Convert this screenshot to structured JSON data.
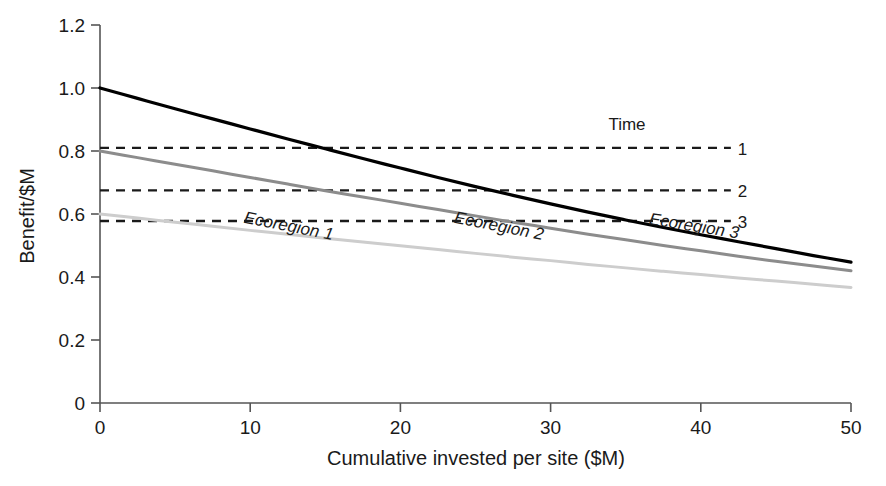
{
  "chart_data": {
    "type": "line",
    "title": "",
    "xlabel": "Cumulative invested per site ($M)",
    "ylabel": "Benefit/$M",
    "xlim": [
      0,
      50
    ],
    "ylim": [
      0,
      1.2
    ],
    "grid": false,
    "legend_position": "inline-right",
    "xticks": [
      "0",
      "10",
      "20",
      "30",
      "40",
      "50"
    ],
    "xtick_values": [
      0,
      10,
      20,
      30,
      40,
      50
    ],
    "yticks": [
      "0",
      "0.2",
      "0.4",
      "0.6",
      "0.8",
      "1.0",
      "1.2"
    ],
    "ytick_values": [
      0,
      0.2,
      0.4,
      0.6,
      0.8,
      1.0,
      1.2
    ],
    "series": [
      {
        "name": "Ecoregion 3",
        "color": "#000000",
        "style": "solid",
        "width": 3.2,
        "label": "Ecoregion 3",
        "label_x": 39.5,
        "label_y": 0.545,
        "label_rotation": 9,
        "x": [
          0,
          2.5,
          5,
          7.5,
          10,
          12.5,
          15,
          17.5,
          20,
          22.5,
          25,
          27.5,
          30,
          32.5,
          35,
          37.5,
          40,
          42.5,
          45,
          47.5,
          50
        ],
        "y": [
          1.0,
          0.967,
          0.934,
          0.902,
          0.87,
          0.838,
          0.807,
          0.776,
          0.746,
          0.716,
          0.687,
          0.659,
          0.632,
          0.606,
          0.581,
          0.557,
          0.534,
          0.512,
          0.49,
          0.468,
          0.447
        ]
      },
      {
        "name": "Ecoregion 2",
        "color": "#8c8c8c",
        "style": "solid",
        "width": 3.0,
        "label": "Ecoregion 2",
        "label_x": 26.5,
        "label_y": 0.545,
        "label_rotation": 11,
        "x": [
          0,
          2.5,
          5,
          7.5,
          10,
          12.5,
          15,
          17.5,
          20,
          22.5,
          25,
          27.5,
          30,
          32.5,
          35,
          37.5,
          40,
          42.5,
          45,
          47.5,
          50
        ],
        "y": [
          0.8,
          0.779,
          0.758,
          0.737,
          0.716,
          0.695,
          0.674,
          0.654,
          0.634,
          0.614,
          0.594,
          0.574,
          0.555,
          0.536,
          0.518,
          0.5,
          0.483,
          0.466,
          0.45,
          0.435,
          0.42
        ]
      },
      {
        "name": "Ecoregion 1",
        "color": "#cdcdcd",
        "style": "solid",
        "width": 3.0,
        "label": "Ecoregion 1",
        "label_x": 12.5,
        "label_y": 0.545,
        "label_rotation": 11,
        "x": [
          0,
          2.5,
          5,
          7.5,
          10,
          12.5,
          15,
          17.5,
          20,
          22.5,
          25,
          27.5,
          30,
          32.5,
          35,
          37.5,
          40,
          42.5,
          45,
          47.5,
          50
        ],
        "y": [
          0.6,
          0.587,
          0.574,
          0.561,
          0.548,
          0.536,
          0.523,
          0.511,
          0.499,
          0.487,
          0.475,
          0.463,
          0.452,
          0.44,
          0.429,
          0.418,
          0.408,
          0.397,
          0.387,
          0.377,
          0.367
        ]
      }
    ],
    "reference_lines": {
      "title": "Time",
      "style": "dashed",
      "color": "#1a1a1a",
      "x_start": 0,
      "x_end": 42,
      "items": [
        {
          "label": "1",
          "value": 0.81
        },
        {
          "label": "2",
          "value": 0.675
        },
        {
          "label": "3",
          "value": 0.578
        }
      ]
    }
  }
}
